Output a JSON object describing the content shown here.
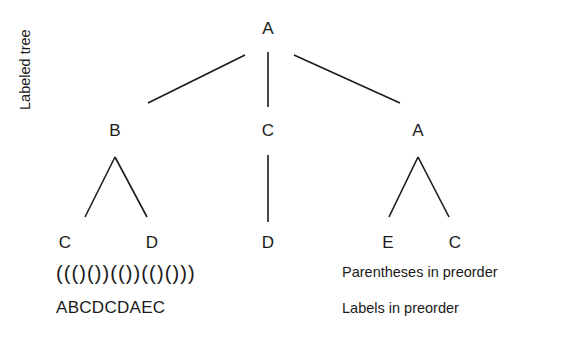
{
  "figure": {
    "background_color": "#ffffff",
    "ink_color": "#1a1a1a",
    "vertical_caption": "Labeled tree",
    "paren_caption": "Parentheses in preorder",
    "label_caption": "Labels in preorder",
    "paren_string": "((()())(())(()()))",
    "label_string": "ABCDCDAEC"
  },
  "tree": {
    "nodes": [
      {
        "id": "n0",
        "label": "A",
        "x": 268,
        "y": 33,
        "level": 0
      },
      {
        "id": "n1",
        "label": "B",
        "x": 115,
        "y": 135,
        "level": 1
      },
      {
        "id": "n2",
        "label": "C",
        "x": 268,
        "y": 135,
        "level": 1
      },
      {
        "id": "n3",
        "label": "A",
        "x": 418,
        "y": 135,
        "level": 1
      },
      {
        "id": "n4",
        "label": "C",
        "x": 65,
        "y": 247,
        "level": 2
      },
      {
        "id": "n5",
        "label": "D",
        "x": 152,
        "y": 247,
        "level": 2
      },
      {
        "id": "n6",
        "label": "D",
        "x": 268,
        "y": 247,
        "level": 2
      },
      {
        "id": "n7",
        "label": "E",
        "x": 388,
        "y": 247,
        "level": 2
      },
      {
        "id": "n8",
        "label": "C",
        "x": 455,
        "y": 247,
        "level": 2
      }
    ],
    "edges": [
      {
        "from": "n0",
        "to": "n1",
        "x1": 245,
        "y1": 55,
        "x2": 148,
        "y2": 103
      },
      {
        "from": "n0",
        "to": "n2",
        "x1": 268,
        "y1": 52,
        "x2": 268,
        "y2": 107
      },
      {
        "from": "n0",
        "to": "n3",
        "x1": 294,
        "y1": 55,
        "x2": 400,
        "y2": 103
      },
      {
        "from": "n1",
        "to": "n4",
        "x1": 115,
        "y1": 157,
        "x2": 85,
        "y2": 217
      },
      {
        "from": "n1",
        "to": "n5",
        "x1": 115,
        "y1": 157,
        "x2": 147,
        "y2": 217
      },
      {
        "from": "n2",
        "to": "n6",
        "x1": 268,
        "y1": 155,
        "x2": 268,
        "y2": 222
      },
      {
        "from": "n3",
        "to": "n7",
        "x1": 418,
        "y1": 157,
        "x2": 389,
        "y2": 217
      },
      {
        "from": "n3",
        "to": "n8",
        "x1": 418,
        "y1": 157,
        "x2": 449,
        "y2": 217
      }
    ]
  }
}
